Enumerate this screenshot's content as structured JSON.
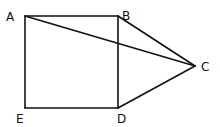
{
  "diagram": {
    "type": "geometry-figure",
    "colors": {
      "line": "#111111",
      "background": "#ffffff"
    },
    "points": [
      {
        "id": "A",
        "label": "A",
        "x": 25,
        "y": 16,
        "label_x": 6,
        "label_y": 21
      },
      {
        "id": "B",
        "label": "B",
        "x": 118,
        "y": 16,
        "label_x": 122,
        "label_y": 20
      },
      {
        "id": "C",
        "label": "C",
        "x": 195,
        "y": 66,
        "label_x": 201,
        "label_y": 71
      },
      {
        "id": "D",
        "label": "D",
        "x": 118,
        "y": 108,
        "label_x": 117,
        "label_y": 123
      },
      {
        "id": "E",
        "label": "E",
        "x": 25,
        "y": 108,
        "label_x": 16,
        "label_y": 123
      }
    ],
    "segments": [
      {
        "from": "A",
        "to": "B"
      },
      {
        "from": "B",
        "to": "D"
      },
      {
        "from": "D",
        "to": "E"
      },
      {
        "from": "E",
        "to": "A"
      },
      {
        "from": "A",
        "to": "C"
      },
      {
        "from": "B",
        "to": "C"
      },
      {
        "from": "D",
        "to": "C"
      }
    ]
  }
}
